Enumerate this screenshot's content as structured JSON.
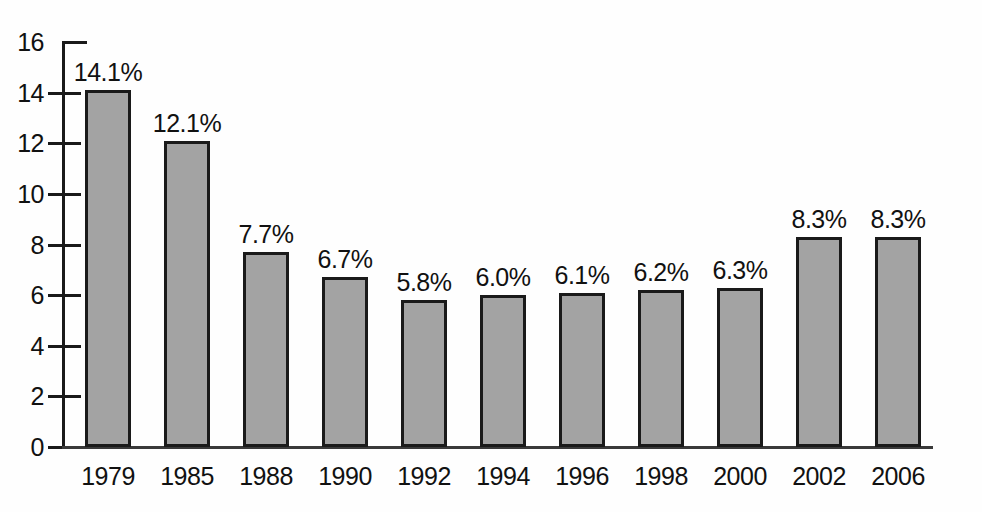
{
  "chart_data": {
    "type": "bar",
    "title": "",
    "subtitle": "",
    "xlabel": "",
    "ylabel": "",
    "categories": [
      "1979",
      "1985",
      "1988",
      "1990",
      "1992",
      "1994",
      "1996",
      "1998",
      "2000",
      "2002",
      "2006"
    ],
    "values": [
      14.1,
      12.1,
      7.7,
      6.7,
      5.8,
      6.0,
      6.1,
      6.2,
      6.3,
      8.3,
      8.3
    ],
    "value_labels": [
      "14.1%",
      "12.1%",
      "7.7%",
      "6.7%",
      "5.8%",
      "6.0%",
      "6.1%",
      "6.2%",
      "6.3%",
      "8.3%",
      "8.3%"
    ],
    "ylim": [
      0,
      16
    ],
    "ytick_values": [
      0,
      2,
      4,
      6,
      8,
      10,
      12,
      14,
      16
    ],
    "ytick_labels": [
      "0",
      "2",
      "4",
      "6",
      "8",
      "10",
      "12",
      "14",
      "16"
    ],
    "grid": false,
    "legend": null,
    "legend_position": "none",
    "series": [
      {
        "name": "",
        "values": [
          14.1,
          12.1,
          7.7,
          6.7,
          5.8,
          6.0,
          6.1,
          6.2,
          6.3,
          8.3,
          8.3
        ]
      }
    ]
  },
  "style": {
    "bar_fill": "#a3a3a3",
    "bar_border": "#1a1a1a",
    "axis_color": "#1a1a1a",
    "text_color": "#111111",
    "background": "#fefefe"
  }
}
